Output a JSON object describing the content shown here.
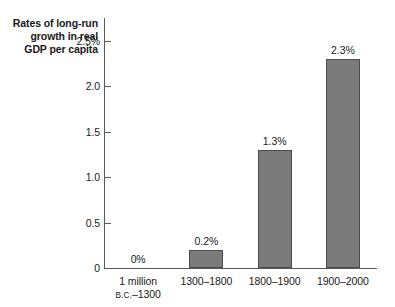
{
  "chart_data": {
    "type": "bar",
    "title": "Rates of long-run\ngrowth in real\nGDP per capita",
    "xlabel": "",
    "ylabel": "",
    "ylim": [
      0,
      2.75
    ],
    "grid": false,
    "legend": null,
    "categories": [
      "1 million B.C.–1300",
      "1300–1800",
      "1800–1900",
      "1900–2000"
    ],
    "category_lines": [
      [
        "1 million",
        "B.C.–1300"
      ],
      [
        "1300–1800"
      ],
      [
        "1800–1900"
      ],
      [
        "1900–2000"
      ]
    ],
    "values": [
      0,
      0.2,
      1.3,
      2.3
    ],
    "data_labels": [
      "0%",
      "0.2%",
      "1.3%",
      "2.3%"
    ],
    "yticks": [
      0,
      0.5,
      1.0,
      1.5,
      2.0,
      2.5
    ],
    "ytick_labels": [
      "0",
      "0.5",
      "1.0",
      "1.5",
      "2.0",
      "2.5%"
    ],
    "colors": {
      "bar_fill": "#7b7b7b",
      "bar_stroke": "#4c4c4c",
      "axis": "#5a5a5a",
      "text": "#1a1a1a",
      "background": "#ffffff"
    }
  }
}
